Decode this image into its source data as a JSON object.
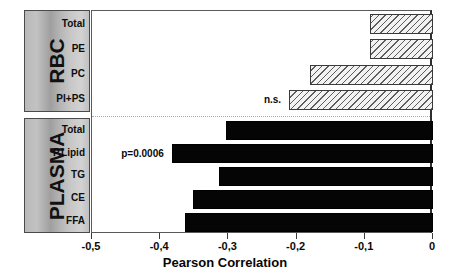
{
  "chart_data": {
    "type": "bar",
    "orientation": "horizontal",
    "title": "",
    "xlabel": "Pearson Correlation",
    "ylabel": "",
    "xlim": [
      -0.5,
      0
    ],
    "xticks": [
      -0.5,
      -0.4,
      -0.3,
      -0.2,
      -0.1,
      0
    ],
    "xticklabels": [
      "-0,5",
      "-0,4",
      "-0,3",
      "-0,2",
      "-0,1",
      "0"
    ],
    "grid": false,
    "legend": false,
    "groups": [
      {
        "name": "RBC",
        "label": "RBC",
        "style": "hatched",
        "categories": [
          "Total",
          "PE",
          "PC",
          "PI+PS"
        ],
        "values": [
          -0.093,
          -0.093,
          -0.181,
          -0.211
        ]
      },
      {
        "name": "PLASMA",
        "label": "PLASMA",
        "style": "solid",
        "categories": [
          "Total",
          "P.Lipid",
          "TG",
          "CE",
          "FFA"
        ],
        "values": [
          -0.304,
          -0.383,
          -0.314,
          -0.352,
          -0.363
        ]
      }
    ],
    "categories": [
      "Total",
      "PE",
      "PC",
      "PI+PS",
      "Total",
      "P.Lipid",
      "TG",
      "CE",
      "FFA"
    ],
    "values": [
      -0.093,
      -0.093,
      -0.181,
      -0.211,
      -0.304,
      -0.383,
      -0.314,
      -0.352,
      -0.363
    ],
    "annotations": [
      {
        "text": "n.s.",
        "target_group": "RBC",
        "target_category": "PI+PS"
      },
      {
        "text": "p=0.0006",
        "target_group": "PLASMA",
        "target_category": "P.Lipid"
      }
    ],
    "colors": {
      "solid_bar": "#050505",
      "hatched_bar_fill": "#f2f2f2",
      "hatched_bar_line": "#5d5d5d",
      "axis": "#3a3a3a",
      "group_box": "#bdbdbd",
      "text": "#0a0a0a"
    }
  }
}
